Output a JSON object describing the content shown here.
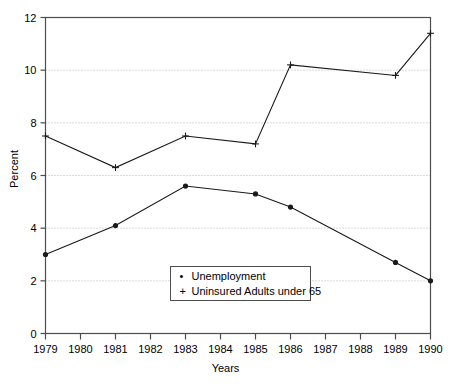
{
  "chart_data": {
    "type": "line",
    "title": "",
    "xlabel": "Years",
    "ylabel": "Percent",
    "xlim": [
      1979,
      1990
    ],
    "ylim": [
      0,
      12
    ],
    "ytick_step": 2,
    "yticks": [
      0,
      2,
      4,
      6,
      8,
      10,
      12
    ],
    "xticks": [
      1979,
      1980,
      1981,
      1982,
      1983,
      1984,
      1985,
      1986,
      1987,
      1988,
      1989,
      1990
    ],
    "grid": "horizontal-dotted",
    "legend_position": "inside-bottom-center",
    "series": [
      {
        "name": "Unemployment",
        "marker": "dot",
        "x": [
          1979,
          1981,
          1983,
          1985,
          1986,
          1989,
          1990
        ],
        "values": [
          3.0,
          4.1,
          5.6,
          5.3,
          4.8,
          2.7,
          2.0
        ]
      },
      {
        "name": "Uninsured Adults under 65",
        "marker": "plus",
        "x": [
          1979,
          1981,
          1983,
          1985,
          1986,
          1989,
          1990
        ],
        "values": [
          7.5,
          6.3,
          7.5,
          7.2,
          10.2,
          9.8,
          11.4
        ]
      }
    ]
  },
  "axes": {
    "ytick_labels": [
      "0",
      "2",
      "4",
      "6",
      "8",
      "10",
      "12"
    ],
    "xtick_labels": [
      "1979",
      "1980",
      "1981",
      "1982",
      "1983",
      "1984",
      "1985",
      "1986",
      "1987",
      "1988",
      "1989",
      "1990"
    ],
    "ylabel": "Percent",
    "xlabel": "Years"
  },
  "legend": {
    "items": [
      {
        "marker": "•",
        "label": "Unemployment"
      },
      {
        "marker": "+",
        "label": "Uninsured Adults under 65"
      }
    ]
  },
  "colors": {
    "line": "#1a1a1a",
    "axis": "#4d4d4d",
    "grid": "#b5b5b5",
    "background": "#ffffff",
    "text": "#000000"
  }
}
